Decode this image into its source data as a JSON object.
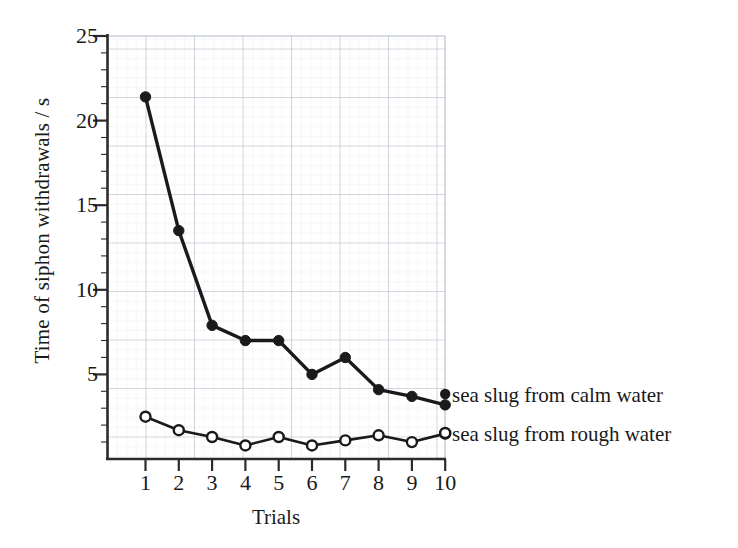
{
  "chart_data": {
    "type": "line",
    "title": "",
    "xlabel": "Trials",
    "ylabel": "Time of siphon withdrawals / s",
    "x": [
      1,
      2,
      3,
      4,
      5,
      6,
      7,
      8,
      9,
      10
    ],
    "xtick_labels": [
      "1",
      "2",
      "3",
      "4",
      "5",
      "6",
      "7",
      "8",
      "9",
      "10"
    ],
    "ytick_labels": [
      "5",
      "10",
      "15",
      "20",
      "25"
    ],
    "ytick_values": [
      5,
      10,
      15,
      20,
      25
    ],
    "xlim": [
      0.55,
      10.45
    ],
    "ylim": [
      0,
      25
    ],
    "grid": true,
    "grid_minor": true,
    "legend_position": "right-inline",
    "series": [
      {
        "name": "sea slug from calm water",
        "marker": "filled-circle",
        "color": "#1a1a1a",
        "values": [
          21.4,
          13.5,
          7.9,
          7.0,
          7.0,
          5.0,
          6.0,
          4.1,
          3.7,
          3.2
        ]
      },
      {
        "name": "sea slug from rough water",
        "marker": "open-circle",
        "color": "#1a1a1a",
        "values": [
          2.5,
          1.7,
          1.3,
          0.8,
          1.3,
          0.8,
          1.1,
          1.4,
          1.0,
          1.5
        ]
      }
    ]
  },
  "axes": {
    "y_title": "Time of siphon withdrawals / s",
    "x_title": "Trials"
  },
  "legend": {
    "entries": [
      {
        "label": "sea slug from calm water",
        "marker": "filled-circle"
      },
      {
        "label": "sea slug from rough water",
        "marker": "open-circle"
      }
    ]
  },
  "colors": {
    "ink": "#1a1a1a",
    "axis": "#2b2b2b",
    "grid_major": "#b9bfc9",
    "grid_minor": "#dfe3ea",
    "background": "#ffffff"
  }
}
